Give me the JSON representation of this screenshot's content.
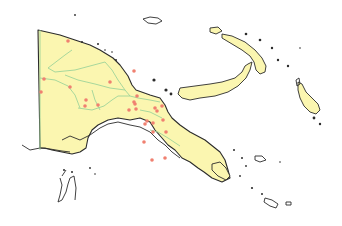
{
  "map": {
    "subject": "Papua New Guinea",
    "land_color": "#fbf6b0",
    "coast_color": "#2b2b2b",
    "border_color": "#9ed49a",
    "marker_color": "#f08070",
    "marker_count": 26,
    "markers": [
      {
        "x": 68,
        "y": 41
      },
      {
        "x": 44,
        "y": 79
      },
      {
        "x": 41,
        "y": 92
      },
      {
        "x": 70,
        "y": 87
      },
      {
        "x": 86,
        "y": 100
      },
      {
        "x": 85,
        "y": 106
      },
      {
        "x": 98,
        "y": 105
      },
      {
        "x": 110,
        "y": 82
      },
      {
        "x": 129,
        "y": 110
      },
      {
        "x": 135,
        "y": 104
      },
      {
        "x": 137,
        "y": 96
      },
      {
        "x": 134,
        "y": 71
      },
      {
        "x": 157,
        "y": 111
      },
      {
        "x": 153,
        "y": 123
      },
      {
        "x": 163,
        "y": 120
      },
      {
        "x": 134,
        "y": 102
      },
      {
        "x": 136,
        "y": 109
      },
      {
        "x": 145,
        "y": 124
      },
      {
        "x": 147,
        "y": 121
      },
      {
        "x": 155,
        "y": 108
      },
      {
        "x": 162,
        "y": 106
      },
      {
        "x": 153,
        "y": 132
      },
      {
        "x": 144,
        "y": 142
      },
      {
        "x": 165,
        "y": 158
      },
      {
        "x": 152,
        "y": 160
      },
      {
        "x": 166,
        "y": 132
      }
    ]
  }
}
